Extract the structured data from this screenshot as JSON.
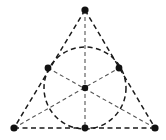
{
  "figure": {
    "background_color": "#ffffff",
    "canvas": {
      "width": 166,
      "height": 140
    },
    "colors": {
      "edge_stroke": "#1a1a1a",
      "circle_stroke": "#1a1a1a",
      "cevian_stroke": "#555555",
      "point_fill": "#111111"
    },
    "style": {
      "edge_dash": "5 3.5",
      "circle_dash": "5 3.5",
      "cevian_dash": "4 3",
      "edge_width": 1.5,
      "circle_width": 1.5,
      "cevian_width": 1.1
    }
  },
  "chart_data": {
    "type": "scatter",
    "xlabel": "",
    "ylabel": "",
    "xlim": [
      0,
      166
    ],
    "ylim": [
      0,
      140
    ],
    "grid": false,
    "legend": null,
    "vertices": [
      {
        "name": "apex-vertex",
        "label": "A",
        "x": 85,
        "y": 10
      },
      {
        "name": "bottom-left-vertex",
        "label": "B",
        "x": 14,
        "y": 128
      },
      {
        "name": "bottom-right-vertex",
        "label": "C",
        "x": 155,
        "y": 128
      }
    ],
    "tangent_points": [
      {
        "name": "left-tangent-point",
        "label": "F",
        "x": 48,
        "y": 68
      },
      {
        "name": "right-tangent-point",
        "label": "E",
        "x": 119,
        "y": 68
      },
      {
        "name": "bottom-tangent-point",
        "label": "D",
        "x": 85,
        "y": 128
      }
    ],
    "center_point": {
      "name": "incenter",
      "label": "I",
      "x": 85,
      "y": 88
    },
    "incircle": {
      "cx": 85,
      "cy": 88,
      "r": 41
    },
    "triangle_edges": [
      {
        "name": "edge-left",
        "x1": 85,
        "y1": 10,
        "x2": 14,
        "y2": 128
      },
      {
        "name": "edge-right",
        "x1": 85,
        "y1": 10,
        "x2": 155,
        "y2": 128
      },
      {
        "name": "edge-bottom",
        "x1": 14,
        "y1": 128,
        "x2": 155,
        "y2": 128
      }
    ],
    "medians": [
      {
        "name": "median-apex-to-bottom",
        "x1": 85,
        "y1": 10,
        "x2": 85,
        "y2": 128
      },
      {
        "name": "median-bottomleft-to-right",
        "x1": 14,
        "y1": 128,
        "x2": 119,
        "y2": 68
      },
      {
        "name": "median-bottomright-to-left",
        "x1": 155,
        "y1": 128,
        "x2": 48,
        "y2": 68
      }
    ],
    "point_radii": {
      "vertex": 3.6,
      "tangent": 3.4,
      "center": 3.2
    }
  }
}
